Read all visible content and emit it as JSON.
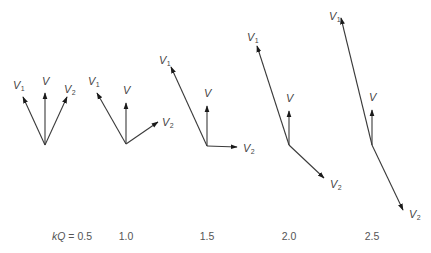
{
  "diagram": {
    "type": "phasor-diagram",
    "parameter_label": "kQ",
    "equals": "=",
    "vector_labels": {
      "V": "V",
      "V1": "V",
      "V1_sub": "1",
      "V2": "V",
      "V2_sub": "2"
    },
    "panels": [
      {
        "kQ": "0.5",
        "caption_prefix": true,
        "vectors": {
          "V": {
            "dx": 0,
            "dy": -52
          },
          "V1": {
            "dx": -22,
            "dy": -48
          },
          "V2": {
            "dx": 22,
            "dy": -48
          }
        }
      },
      {
        "kQ": "1.0",
        "caption_prefix": false,
        "vectors": {
          "V": {
            "dx": 0,
            "dy": -41
          },
          "V1": {
            "dx": -29,
            "dy": -51
          },
          "V2": {
            "dx": 32,
            "dy": -22
          }
        }
      },
      {
        "kQ": "1.5",
        "caption_prefix": false,
        "vectors": {
          "V": {
            "dx": 0,
            "dy": -40
          },
          "V1": {
            "dx": -36,
            "dy": -79
          },
          "V2": {
            "dx": 30,
            "dy": 1
          }
        }
      },
      {
        "kQ": "2.0",
        "caption_prefix": false,
        "vectors": {
          "V": {
            "dx": 0,
            "dy": -34
          },
          "V1": {
            "dx": -32,
            "dy": -99
          },
          "V2": {
            "dx": 35,
            "dy": 33
          }
        }
      },
      {
        "kQ": "2.5",
        "caption_prefix": false,
        "vectors": {
          "V": {
            "dx": 0,
            "dy": -35
          },
          "V1": {
            "dx": -31,
            "dy": -127
          },
          "V2": {
            "dx": 31,
            "dy": 65
          }
        }
      }
    ]
  }
}
